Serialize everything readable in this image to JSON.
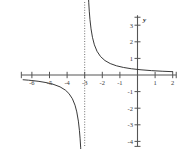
{
  "chart_data": {
    "type": "line",
    "title": "",
    "xlabel": "",
    "ylabel": "y",
    "xlim": [
      -6.6,
      2.2
    ],
    "ylim": [
      -4.3,
      3.6
    ],
    "grid": false,
    "legend": null,
    "x_ticks": [
      -6,
      -5,
      -4,
      -3,
      -2,
      -1,
      1,
      2
    ],
    "x_tick_labels": [
      "-6",
      "-5",
      "-4",
      "-3",
      "-2",
      "-1",
      "1",
      "2"
    ],
    "y_ticks": [
      3,
      2,
      1,
      -1,
      -2,
      -3,
      -4
    ],
    "y_tick_labels": [
      "3",
      "2",
      "1",
      "-1",
      "-2",
      "-3",
      "-4"
    ],
    "asymptotes": [
      {
        "kind": "vertical",
        "x": -3,
        "style": "dotted",
        "label": "x = -3"
      },
      {
        "kind": "horizontal",
        "y": 0,
        "style": "axis",
        "label": "y = 0"
      }
    ],
    "series": [
      {
        "name": "left-branch",
        "comment": "y = 1/(x+3) for x < -3, approaches 0 from below, dives to -infinity near x=-3",
        "x": [
          -6.5,
          -6.2,
          -6.0,
          -5.6,
          -5.2,
          -4.8,
          -4.4,
          -4.1,
          -3.9,
          -3.7,
          -3.55,
          -3.45,
          -3.36,
          -3.3,
          -3.26,
          -3.23,
          -3.2,
          -3.18,
          -3.16
        ],
        "y": [
          -0.286,
          -0.312,
          -0.333,
          -0.385,
          -0.455,
          -0.556,
          -0.714,
          -0.909,
          -1.111,
          -1.429,
          -1.818,
          -2.222,
          -2.778,
          -3.333,
          -3.846,
          -4.35,
          -5.0,
          -5.56,
          -6.25
        ]
      },
      {
        "name": "right-branch",
        "comment": "y = 1/(x+3) for x > -3, from +infinity near x=-3 decaying toward 0",
        "x": [
          -2.84,
          -2.82,
          -2.8,
          -2.77,
          -2.74,
          -2.7,
          -2.64,
          -2.56,
          -2.45,
          -2.3,
          -2.1,
          -1.85,
          -1.55,
          -1.2,
          -0.8,
          -0.35,
          0.2,
          0.8,
          1.4,
          2.0
        ],
        "y": [
          6.25,
          5.56,
          5.0,
          4.35,
          3.846,
          3.333,
          2.778,
          2.273,
          1.818,
          1.429,
          1.111,
          0.87,
          0.69,
          0.556,
          0.455,
          0.377,
          0.313,
          0.263,
          0.227,
          0.2
        ]
      }
    ],
    "colors": {
      "curve": "#2e2e2e",
      "axis": "#555555",
      "asymptote": "#6f6f6f",
      "background": "#ffffff",
      "tick_text": "#3a3a3a"
    }
  }
}
